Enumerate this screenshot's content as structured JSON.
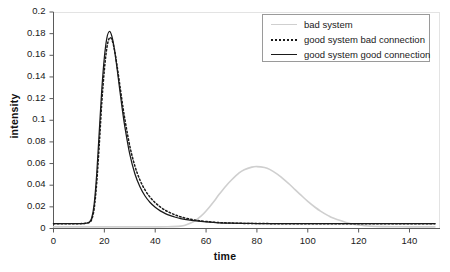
{
  "chart_data": {
    "type": "line",
    "title": "",
    "xlabel": "time",
    "ylabel": "intensity",
    "xlim": [
      0,
      152
    ],
    "ylim": [
      0,
      0.2
    ],
    "grid": false,
    "legend_position": "top-right",
    "xticks": [
      0,
      20,
      40,
      60,
      80,
      100,
      120,
      140
    ],
    "yticks": [
      0,
      0.02,
      0.04,
      0.06,
      0.08,
      0.1,
      0.12,
      0.14,
      0.16,
      0.18,
      0.2
    ],
    "xtick_labels": [
      "0",
      "20",
      "40",
      "60",
      "80",
      "100",
      "120",
      "140"
    ],
    "ytick_labels": [
      "0",
      "0.02",
      "0.04",
      "0.06",
      "0.08",
      "0.1",
      "0.12",
      "0.14",
      "0.16",
      "0.18",
      "0.2"
    ],
    "series": [
      {
        "name": "bad system",
        "color": "#cfcfcf",
        "style": "solid",
        "peak_x": 79,
        "peak_y": 0.057,
        "x": [
          0,
          5,
          10,
          15,
          20,
          25,
          30,
          35,
          40,
          45,
          50,
          52,
          55,
          58,
          60,
          63,
          65,
          68,
          70,
          73,
          75,
          78,
          80,
          83,
          85,
          88,
          90,
          93,
          95,
          98,
          100,
          103,
          105,
          108,
          110,
          115,
          120,
          125,
          130,
          135,
          140,
          145,
          150
        ],
        "y": [
          0.0015,
          0.0015,
          0.0015,
          0.0015,
          0.0015,
          0.0015,
          0.0015,
          0.0015,
          0.0015,
          0.0016,
          0.0022,
          0.0032,
          0.0062,
          0.0115,
          0.0162,
          0.0248,
          0.0311,
          0.0398,
          0.0448,
          0.0513,
          0.0543,
          0.0567,
          0.0572,
          0.0563,
          0.0546,
          0.0503,
          0.0466,
          0.0404,
          0.0359,
          0.0293,
          0.0251,
          0.0194,
          0.0161,
          0.0119,
          0.0096,
          0.0056,
          0.0032,
          0.0021,
          0.0017,
          0.0016,
          0.0015,
          0.0015,
          0.0015
        ]
      },
      {
        "name": "good system bad connection",
        "color": "#1a1a1a",
        "style": "dotted",
        "peak_x": 22,
        "peak_y": 0.176,
        "x": [
          0,
          3,
          6,
          9,
          12,
          14,
          15,
          16,
          17,
          18,
          19,
          20,
          21,
          22,
          23,
          24,
          25,
          26,
          27,
          28,
          30,
          32,
          34,
          36,
          38,
          40,
          42,
          44,
          46,
          48,
          50,
          53,
          56,
          60,
          65,
          70,
          75,
          80,
          85,
          90,
          100,
          110,
          120,
          130,
          140,
          150
        ],
        "y": [
          0.0045,
          0.0045,
          0.0045,
          0.0045,
          0.0046,
          0.0055,
          0.0082,
          0.0185,
          0.0425,
          0.0775,
          0.1165,
          0.1465,
          0.1672,
          0.176,
          0.1742,
          0.1648,
          0.1503,
          0.1338,
          0.1172,
          0.1018,
          0.0762,
          0.0578,
          0.0448,
          0.0356,
          0.0288,
          0.0238,
          0.0199,
          0.0168,
          0.0144,
          0.0124,
          0.0108,
          0.009,
          0.0077,
          0.0065,
          0.0055,
          0.005,
          0.0047,
          0.0046,
          0.0045,
          0.0045,
          0.0045,
          0.0045,
          0.0045,
          0.0045,
          0.0045,
          0.0045
        ]
      },
      {
        "name": "good system good connection",
        "color": "#1a1a1a",
        "style": "solid",
        "peak_x": 21.5,
        "peak_y": 0.182,
        "x": [
          0,
          3,
          6,
          9,
          12,
          14,
          15,
          16,
          17,
          18,
          19,
          20,
          21,
          22,
          23,
          24,
          25,
          26,
          27,
          28,
          30,
          32,
          34,
          36,
          38,
          40,
          42,
          44,
          46,
          48,
          50,
          53,
          56,
          60,
          65,
          70,
          75,
          80,
          85,
          90,
          100,
          110,
          120,
          130,
          140,
          150
        ],
        "y": [
          0.0045,
          0.0045,
          0.0045,
          0.0045,
          0.0046,
          0.0058,
          0.0095,
          0.0225,
          0.0505,
          0.0895,
          0.1285,
          0.158,
          0.1762,
          0.182,
          0.1772,
          0.1648,
          0.1478,
          0.1292,
          0.1112,
          0.0948,
          0.0686,
          0.0506,
          0.0385,
          0.03,
          0.024,
          0.0196,
          0.0163,
          0.0138,
          0.0119,
          0.0104,
          0.0092,
          0.0079,
          0.007,
          0.0061,
          0.0053,
          0.0049,
          0.0047,
          0.0046,
          0.0045,
          0.0045,
          0.0045,
          0.0045,
          0.0045,
          0.0045,
          0.0045,
          0.0045
        ]
      }
    ]
  },
  "legend": {
    "items": [
      {
        "label": "bad system"
      },
      {
        "label": "good system bad connection"
      },
      {
        "label": "good system good connection"
      }
    ]
  }
}
